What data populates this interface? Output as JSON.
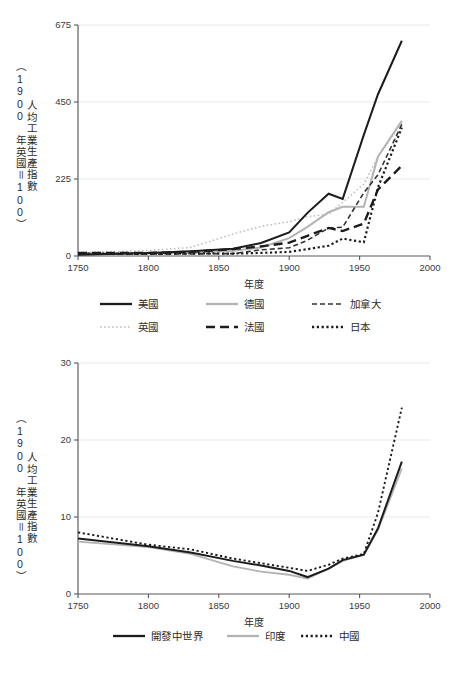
{
  "chart_data": [
    {
      "id": "chart-top",
      "type": "line",
      "title": "",
      "xlabel": "年度",
      "ylabel": "人均工業生產指數（1900 年英國＝100）",
      "ylabel_main": "人均工業生產指數",
      "ylabel_paren": "（1900 年英國＝100）",
      "xlim": [
        1750,
        2000
      ],
      "ylim": [
        0,
        675
      ],
      "xticks": [
        1750,
        1800,
        1850,
        1900,
        1950,
        2000
      ],
      "yticks": [
        0,
        225,
        450,
        675
      ],
      "grid": true,
      "legend_position": "below",
      "series": [
        {
          "name": "美國",
          "style": "solid",
          "color": "#1c1c1c",
          "width": 2.0,
          "x": [
            1750,
            1800,
            1830,
            1860,
            1880,
            1900,
            1913,
            1928,
            1938,
            1953,
            1963,
            1980
          ],
          "y": [
            4,
            9,
            14,
            21,
            38,
            69,
            126,
            182,
            167,
            354,
            472,
            629
          ]
        },
        {
          "name": "英國",
          "style": "dotted-light",
          "color": "#bdbdbd",
          "width": 1.5,
          "x": [
            1750,
            1800,
            1830,
            1860,
            1880,
            1900,
            1913,
            1928,
            1938,
            1953,
            1963,
            1980
          ],
          "y": [
            10,
            16,
            25,
            64,
            87,
            100,
            115,
            122,
            157,
            210,
            290,
            390
          ]
        },
        {
          "name": "德國",
          "style": "solid",
          "color": "#b3b3b3",
          "width": 2.0,
          "x": [
            1750,
            1800,
            1830,
            1860,
            1880,
            1900,
            1913,
            1928,
            1938,
            1953,
            1963,
            1980
          ],
          "y": [
            8,
            8,
            9,
            15,
            25,
            52,
            85,
            128,
            144,
            144,
            290,
            395
          ]
        },
        {
          "name": "法國",
          "style": "long-dash",
          "color": "#1c1c1c",
          "width": 2.4,
          "x": [
            1750,
            1800,
            1830,
            1860,
            1880,
            1900,
            1913,
            1928,
            1938,
            1953,
            1963,
            1980
          ],
          "y": [
            9,
            9,
            12,
            20,
            28,
            39,
            59,
            82,
            73,
            95,
            194,
            264
          ]
        },
        {
          "name": "加拿大",
          "style": "dash",
          "color": "#333333",
          "width": 1.6,
          "x": [
            1750,
            1800,
            1830,
            1860,
            1880,
            1900,
            1913,
            1928,
            1938,
            1953,
            1963,
            1980
          ],
          "y": [
            5,
            5,
            6,
            7,
            18,
            24,
            46,
            82,
            84,
            185,
            237,
            385
          ]
        },
        {
          "name": "日本",
          "style": "dotted",
          "color": "#1c1c1c",
          "width": 2.2,
          "x": [
            1750,
            1800,
            1830,
            1860,
            1880,
            1900,
            1913,
            1928,
            1938,
            1953,
            1963,
            1980
          ],
          "y": [
            7,
            7,
            8,
            7,
            9,
            12,
            20,
            30,
            51,
            40,
            200,
            375
          ]
        }
      ]
    },
    {
      "id": "chart-bottom",
      "type": "line",
      "title": "",
      "xlabel": "年度",
      "ylabel": "人均工業生產指數（1900 年英國＝100）",
      "ylabel_main": "人均工業生產指數",
      "ylabel_paren": "（1900 年英國＝100）",
      "xlim": [
        1750,
        2000
      ],
      "ylim": [
        0,
        30
      ],
      "xticks": [
        1750,
        1800,
        1850,
        1900,
        1950,
        2000
      ],
      "yticks": [
        0,
        10,
        20,
        30
      ],
      "grid": true,
      "legend_position": "below",
      "series": [
        {
          "name": "開發中世界",
          "style": "solid",
          "color": "#1c1c1c",
          "width": 2.0,
          "x": [
            1750,
            1800,
            1830,
            1860,
            1880,
            1900,
            1913,
            1928,
            1938,
            1953,
            1963,
            1980
          ],
          "y": [
            7.2,
            6.2,
            5.4,
            4.3,
            3.7,
            3.0,
            2.2,
            3.3,
            4.4,
            5.1,
            8.5,
            17.2
          ]
        },
        {
          "name": "印度",
          "style": "solid",
          "color": "#b3b3b3",
          "width": 1.8,
          "x": [
            1750,
            1800,
            1830,
            1860,
            1880,
            1900,
            1913,
            1928,
            1938,
            1953,
            1963,
            1980
          ],
          "y": [
            6.8,
            6.1,
            5.2,
            3.6,
            2.9,
            2.5,
            2.0,
            3.3,
            4.3,
            5.1,
            8.3,
            16.3
          ]
        },
        {
          "name": "中國",
          "style": "dotted",
          "color": "#1c1c1c",
          "width": 1.9,
          "x": [
            1750,
            1800,
            1830,
            1860,
            1880,
            1900,
            1913,
            1928,
            1938,
            1953,
            1963,
            1980
          ],
          "y": [
            8.0,
            6.4,
            5.8,
            4.6,
            4.0,
            3.4,
            3.0,
            3.8,
            4.6,
            5.2,
            10.5,
            24.2
          ]
        }
      ]
    }
  ],
  "charts": {
    "top": {
      "legend": [
        {
          "label": "美國",
          "style": "solid",
          "color": "#1c1c1c"
        },
        {
          "label": "德國",
          "style": "solid",
          "color": "#b3b3b3"
        },
        {
          "label": "加拿大",
          "style": "dash",
          "color": "#333333"
        },
        {
          "label": "英國",
          "style": "dotted-light",
          "color": "#bdbdbd"
        },
        {
          "label": "法國",
          "style": "long-dash",
          "color": "#1c1c1c"
        },
        {
          "label": "日本",
          "style": "dotted",
          "color": "#1c1c1c"
        }
      ]
    },
    "bottom": {
      "legend": [
        {
          "label": "開發中世界",
          "style": "solid",
          "color": "#1c1c1c"
        },
        {
          "label": "印度",
          "style": "solid",
          "color": "#b3b3b3"
        },
        {
          "label": "中國",
          "style": "dotted",
          "color": "#1c1c1c"
        }
      ]
    }
  }
}
